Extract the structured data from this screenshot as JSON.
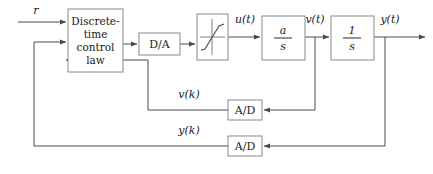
{
  "diagram": {
    "type": "control-system-block-diagram",
    "colors": {
      "background": "#ffffff",
      "block_stroke": "#8a8a8a",
      "wire": "#4a4a4a",
      "text": "#1a1a1a"
    },
    "blocks": [
      {
        "id": "controller",
        "label_lines": [
          "Discrete-",
          "time",
          "control",
          "law"
        ],
        "x": 68,
        "y": 9,
        "w": 55,
        "h": 63
      },
      {
        "id": "da",
        "label": "D/A",
        "x": 139,
        "y": 33,
        "w": 41,
        "h": 22
      },
      {
        "id": "saturation",
        "label": "",
        "x": 197,
        "y": 14,
        "w": 31,
        "h": 46
      },
      {
        "id": "plant-gain",
        "numerator": "a",
        "denominator": "s",
        "x": 262,
        "y": 16,
        "w": 43,
        "h": 44
      },
      {
        "id": "integrator",
        "numerator": "1",
        "denominator": "s",
        "x": 331,
        "y": 16,
        "w": 43,
        "h": 44
      },
      {
        "id": "ad-inner",
        "label": "A/D",
        "x": 228,
        "y": 100,
        "w": 34,
        "h": 20
      },
      {
        "id": "ad-outer",
        "label": "A/D",
        "x": 228,
        "y": 136,
        "w": 34,
        "h": 20
      }
    ],
    "signals": [
      {
        "id": "reference",
        "label": "r",
        "x": 36,
        "y": 14
      },
      {
        "id": "control-input",
        "label": "u(t)",
        "x": 245,
        "y": 23
      },
      {
        "id": "velocity",
        "label": "v(t)",
        "x": 315,
        "y": 23
      },
      {
        "id": "output",
        "label": "y(t)",
        "x": 390,
        "y": 23
      },
      {
        "id": "velocity-sampled",
        "label": "v(k)",
        "x": 189,
        "y": 98
      },
      {
        "id": "output-sampled",
        "label": "y(k)",
        "x": 189,
        "y": 134
      }
    ]
  }
}
